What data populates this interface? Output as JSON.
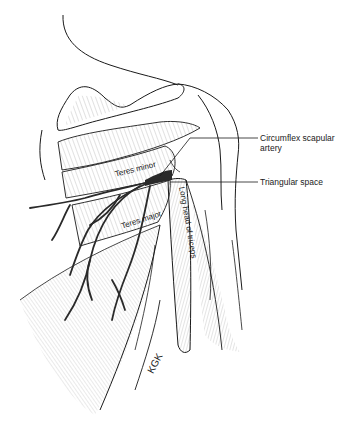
{
  "figure": {
    "labels": {
      "circumflex_scapular_artery_line1": "Circumflex scapular",
      "circumflex_scapular_artery_line2": "artery",
      "triangular_space": "Triangular space",
      "teres_minor": "Teres minor",
      "teres_major": "Teres major",
      "long_head_of_triceps": "Long head of triceps"
    },
    "signature": "KGK",
    "colors": {
      "ink": "#1a1a1a",
      "shade": "#9a9a9a",
      "artery": "#2a2a2a",
      "background": "#ffffff"
    }
  }
}
